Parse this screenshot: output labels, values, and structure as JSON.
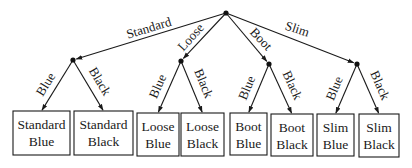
{
  "diagram": {
    "type": "tree",
    "root": {
      "x": 226,
      "y": 13
    },
    "level1": [
      {
        "label": "Standard",
        "x": 73,
        "y": 60,
        "label_pos": {
          "x": 150,
          "y": 32,
          "angle": -17
        }
      },
      {
        "label": "Loose",
        "x": 181,
        "y": 61,
        "label_pos": {
          "x": 194,
          "y": 40,
          "angle": -48
        }
      },
      {
        "label": "Boot",
        "x": 269,
        "y": 64,
        "label_pos": {
          "x": 258,
          "y": 42,
          "angle": 47
        }
      },
      {
        "label": "Slim",
        "x": 357,
        "y": 64,
        "label_pos": {
          "x": 296,
          "y": 33,
          "angle": 18
        }
      }
    ],
    "branch_labels": {
      "left": "Blue",
      "right": "Black"
    },
    "leaves": [
      {
        "line1": "Standard",
        "line2": "Blue",
        "x": 13,
        "y": 111,
        "w": 57,
        "h": 44
      },
      {
        "line1": "Standard",
        "line2": "Black",
        "x": 74,
        "y": 111,
        "w": 59,
        "h": 44
      },
      {
        "line1": "Loose",
        "line2": "Blue",
        "x": 137,
        "y": 113,
        "w": 42,
        "h": 43
      },
      {
        "line1": "Loose",
        "line2": "Black",
        "x": 181,
        "y": 113,
        "w": 43,
        "h": 43
      },
      {
        "line1": "Boot",
        "line2": "Blue",
        "x": 230,
        "y": 113,
        "w": 37,
        "h": 42
      },
      {
        "line1": "Boot",
        "line2": "Black",
        "x": 271,
        "y": 114,
        "w": 42,
        "h": 42
      },
      {
        "line1": "Slim",
        "line2": "Blue",
        "x": 317,
        "y": 114,
        "w": 37,
        "h": 42
      },
      {
        "line1": "Slim",
        "line2": "Black",
        "x": 359,
        "y": 114,
        "w": 40,
        "h": 43
      }
    ],
    "colors": {
      "line": "#1a1a1a",
      "background": "#ffffff"
    }
  }
}
